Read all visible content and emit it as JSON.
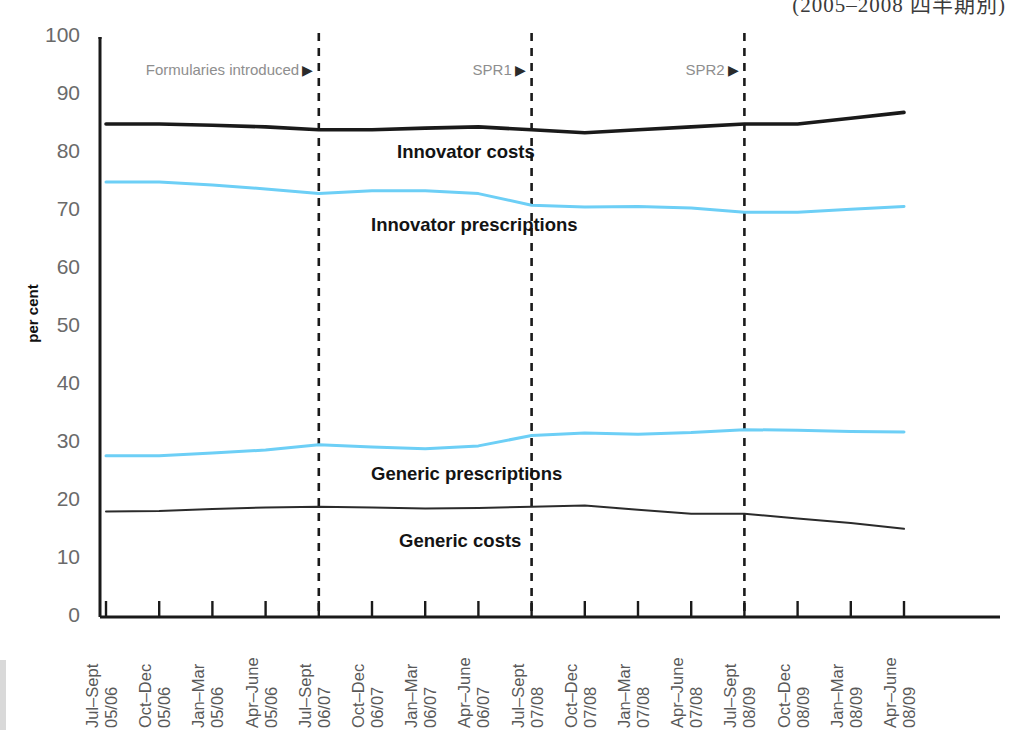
{
  "header": {
    "title_clipped": "(2005–2008 四半期別)"
  },
  "axes": {
    "y_title": "per cent",
    "y_ticks": [
      "100",
      "90",
      "80",
      "70",
      "60",
      "50",
      "40",
      "30",
      "20",
      "10",
      "0"
    ],
    "x_ticks": [
      {
        "line1": "Jul–Sept",
        "line2": "05/06"
      },
      {
        "line1": "Oct–Dec",
        "line2": "05/06"
      },
      {
        "line1": "Jan–Mar",
        "line2": "05/06"
      },
      {
        "line1": "Apr–June",
        "line2": "05/06"
      },
      {
        "line1": "Jul–Sept",
        "line2": "06/07"
      },
      {
        "line1": "Oct–Dec",
        "line2": "06/07"
      },
      {
        "line1": "Jan–Mar",
        "line2": "06/07"
      },
      {
        "line1": "Apr–June",
        "line2": "06/07"
      },
      {
        "line1": "Jul–Sept",
        "line2": "07/08"
      },
      {
        "line1": "Oct–Dec",
        "line2": "07/08"
      },
      {
        "line1": "Jan–Mar",
        "line2": "07/08"
      },
      {
        "line1": "Apr–June",
        "line2": "07/08"
      },
      {
        "line1": "Jul–Sept",
        "line2": "08/09"
      },
      {
        "line1": "Oct–Dec",
        "line2": "08/09"
      },
      {
        "line1": "Jan–Mar",
        "line2": "08/09"
      },
      {
        "line1": "Apr–June",
        "line2": "08/09"
      }
    ]
  },
  "series_labels": [
    {
      "name": "innovator-costs",
      "text": "Innovator costs"
    },
    {
      "name": "innovator-prescriptions",
      "text": "Innovator prescriptions"
    },
    {
      "name": "generic-prescriptions",
      "text": "Generic prescriptions"
    },
    {
      "name": "generic-costs",
      "text": "Generic costs"
    }
  ],
  "annotations": [
    {
      "name": "formularies-introduced",
      "text": "Formularies introduced",
      "arrow": "▶",
      "at_index": 4
    },
    {
      "name": "spr1",
      "text": "SPR1",
      "arrow": "▶",
      "at_index": 8
    },
    {
      "name": "spr2",
      "text": "SPR2",
      "arrow": "▶",
      "at_index": 12
    }
  ],
  "colors": {
    "innovator_costs": "#1a1a1a",
    "innovator_prescriptions": "#6dcff6",
    "generic_prescriptions": "#6dcff6",
    "generic_costs": "#2b2b2b",
    "axis": "#1a1a1a",
    "event_line": "#1a1a1a",
    "tick_label": "#6a6a6a"
  },
  "chart_data": {
    "type": "line",
    "title": "(2005–2008 四半期別)",
    "xlabel": "",
    "ylabel": "per cent",
    "ylim": [
      0,
      100
    ],
    "ytick_step": 10,
    "grid": false,
    "legend": "inline-labels",
    "x": [
      "Jul–Sept 05/06",
      "Oct–Dec 05/06",
      "Jan–Mar 05/06",
      "Apr–June 05/06",
      "Jul–Sept 06/07",
      "Oct–Dec 06/07",
      "Jan–Mar 06/07",
      "Apr–June 06/07",
      "Jul–Sept 07/08",
      "Oct–Dec 07/08",
      "Jan–Mar 07/08",
      "Apr–June 07/08",
      "Jul–Sept 08/09",
      "Oct–Dec 08/09",
      "Jan–Mar 08/09",
      "Apr–June 08/09"
    ],
    "series": [
      {
        "name": "Innovator costs",
        "color": "#1a1a1a",
        "width": 3.6,
        "values": [
          85.0,
          85.0,
          84.8,
          84.5,
          84.0,
          84.0,
          84.3,
          84.5,
          84.0,
          83.5,
          84.0,
          84.5,
          85.0,
          85.0,
          86.0,
          87.0
        ]
      },
      {
        "name": "Innovator prescriptions",
        "color": "#6dcff6",
        "width": 3.0,
        "values": [
          75.0,
          75.0,
          74.5,
          73.8,
          73.0,
          73.5,
          73.5,
          73.0,
          71.0,
          70.7,
          70.8,
          70.5,
          69.8,
          69.8,
          70.3,
          70.8
        ]
      },
      {
        "name": "Generic prescriptions",
        "color": "#6dcff6",
        "width": 3.0,
        "values": [
          27.8,
          27.8,
          28.3,
          28.8,
          29.7,
          29.3,
          29.0,
          29.5,
          31.3,
          31.7,
          31.5,
          31.8,
          32.3,
          32.2,
          32.0,
          31.9
        ]
      },
      {
        "name": "Generic costs",
        "color": "#2b2b2b",
        "width": 2.0,
        "values": [
          18.2,
          18.3,
          18.6,
          18.9,
          19.0,
          18.9,
          18.7,
          18.8,
          19.0,
          19.2,
          18.5,
          17.8,
          17.8,
          17.0,
          16.2,
          15.2
        ]
      }
    ],
    "event_lines": [
      {
        "label": "Formularies introduced",
        "x_index": 4
      },
      {
        "label": "SPR1",
        "x_index": 8
      },
      {
        "label": "SPR2",
        "x_index": 12
      }
    ]
  }
}
